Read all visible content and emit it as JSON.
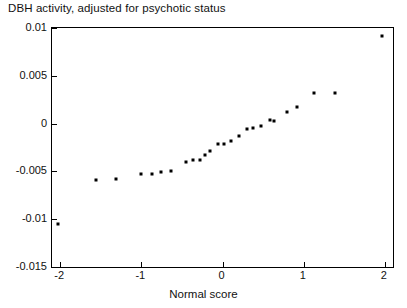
{
  "chart_data": {
    "type": "scatter",
    "title": "DBH activity, adjusted for psychotic status",
    "xlabel": "Normal score",
    "ylabel": "",
    "xlim": [
      -2.1,
      2.1
    ],
    "ylim": [
      -0.015,
      0.01
    ],
    "grid": false,
    "legend": null,
    "xticks": [
      -2,
      -1,
      0,
      1,
      2
    ],
    "xtick_labels": [
      "-2",
      "-1",
      "0",
      "1",
      "2"
    ],
    "yticks": [
      0.01,
      0.005,
      0,
      -0.005,
      -0.01,
      -0.015
    ],
    "ytick_labels": [
      "0.01",
      "0.005",
      "0",
      "-0.005",
      "-0.01",
      "-0.015"
    ],
    "marker": "square",
    "marker_color": "#000000",
    "points": [
      {
        "x": -2.03,
        "y": -0.01045
      },
      {
        "x": -1.56,
        "y": -0.00595
      },
      {
        "x": -1.31,
        "y": -0.00575
      },
      {
        "x": -1.0,
        "y": -0.00522
      },
      {
        "x": -0.87,
        "y": -0.00528
      },
      {
        "x": -0.76,
        "y": -0.00505
      },
      {
        "x": -0.63,
        "y": -0.005
      },
      {
        "x": -0.45,
        "y": -0.004
      },
      {
        "x": -0.36,
        "y": -0.00385
      },
      {
        "x": -0.28,
        "y": -0.00382
      },
      {
        "x": -0.22,
        "y": -0.00333
      },
      {
        "x": -0.15,
        "y": -0.00282
      },
      {
        "x": -0.05,
        "y": -0.00218
      },
      {
        "x": 0.02,
        "y": -0.00212
      },
      {
        "x": 0.1,
        "y": -0.00185
      },
      {
        "x": 0.2,
        "y": -0.00128
      },
      {
        "x": 0.3,
        "y": -0.00055
      },
      {
        "x": 0.38,
        "y": -0.00048
      },
      {
        "x": 0.48,
        "y": -0.00028
      },
      {
        "x": 0.58,
        "y": 0.00035
      },
      {
        "x": 0.63,
        "y": 0.00032
      },
      {
        "x": 0.79,
        "y": 0.00118
      },
      {
        "x": 0.92,
        "y": 0.00175
      },
      {
        "x": 1.13,
        "y": 0.0032
      },
      {
        "x": 1.39,
        "y": 0.00318
      },
      {
        "x": 1.96,
        "y": 0.0092
      }
    ]
  }
}
